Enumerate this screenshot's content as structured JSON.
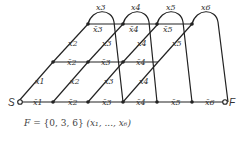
{
  "diagram": {
    "type": "lattice-graph",
    "source_label": "S",
    "sink_label": "F",
    "top_arc_labels": [
      "x3",
      "x4",
      "x5",
      "x6"
    ],
    "rows": {
      "bottom": {
        "edge_labels": [
          "x̄1",
          "x̄2",
          "x̄3",
          "x̄4",
          "x̄5",
          "x̄6"
        ]
      },
      "middle": {
        "edge_labels": [
          "x̄2",
          "x̄3",
          "x̄4"
        ]
      },
      "top": {
        "edge_labels": [
          "x̄3",
          "x̄4",
          "x̄5"
        ]
      }
    },
    "diagonal_labels": {
      "lower": [
        "x1",
        "x2",
        "x3",
        "x4"
      ],
      "upper": [
        "x2",
        "x3",
        "x4",
        "x5"
      ],
      "middle_top": [
        "x3",
        "x4"
      ]
    },
    "caption": {
      "set_name": "F",
      "equals": "=",
      "set_value": "{0, 3, 6}",
      "variables": "(x₁, ..., x₆)"
    },
    "colors": {
      "stroke": "#222222",
      "text": "#333333",
      "background": "#ffffff"
    }
  }
}
